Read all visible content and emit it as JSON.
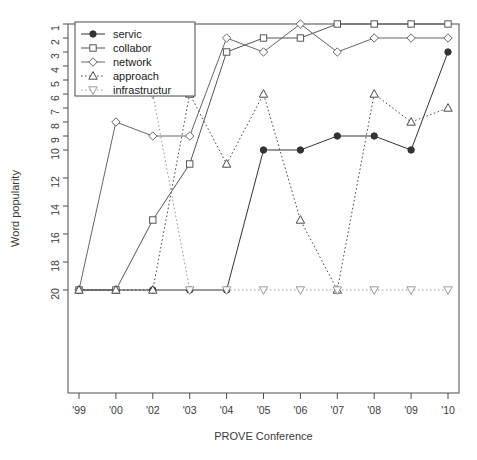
{
  "chart_data": {
    "type": "line",
    "title": "",
    "xlabel": "PROVE Conference",
    "ylabel": "Word popularity",
    "categories": [
      "'99",
      "'00",
      "'02",
      "'03",
      "'04",
      "'05",
      "'06",
      "'07",
      "'08",
      "'09",
      "'10"
    ],
    "y_ticks": [
      1,
      2,
      3,
      4,
      5,
      6,
      7,
      8,
      9,
      10,
      12,
      14,
      16,
      18,
      20
    ],
    "ylim": [
      1,
      20
    ],
    "y_inverted": true,
    "grid": false,
    "legend_position": "top-left",
    "series": [
      {
        "name": "servic",
        "marker": "filled-circle",
        "linestyle": "solid",
        "color": "#333333",
        "values": [
          20,
          20,
          20,
          20,
          20,
          10,
          10,
          9,
          9,
          10,
          3
        ]
      },
      {
        "name": "collabor",
        "marker": "square",
        "linestyle": "solid",
        "color": "#555555",
        "values": [
          20,
          20,
          15,
          11,
          3,
          2,
          2,
          1,
          1,
          1,
          1
        ]
      },
      {
        "name": "network",
        "marker": "diamond",
        "linestyle": "solid",
        "color": "#666666",
        "values": [
          20,
          8,
          9,
          9,
          2,
          3,
          1,
          3,
          2,
          2,
          2
        ]
      },
      {
        "name": "approach",
        "marker": "triangle-up",
        "linestyle": "dotted",
        "color": "#4a4a4a",
        "values": [
          20,
          20,
          20,
          6,
          11,
          6,
          15,
          20,
          6,
          8,
          7
        ]
      },
      {
        "name": "infrastructur",
        "marker": "triangle-down",
        "linestyle": "dotted",
        "color": "#9a9a9a",
        "values": [
          5,
          5,
          6,
          20,
          20,
          20,
          20,
          20,
          20,
          20,
          20
        ]
      }
    ]
  },
  "legend": {
    "items": [
      {
        "label": "servic"
      },
      {
        "label": "collabor"
      },
      {
        "label": "network"
      },
      {
        "label": "approach"
      },
      {
        "label": "infrastructur"
      }
    ]
  }
}
